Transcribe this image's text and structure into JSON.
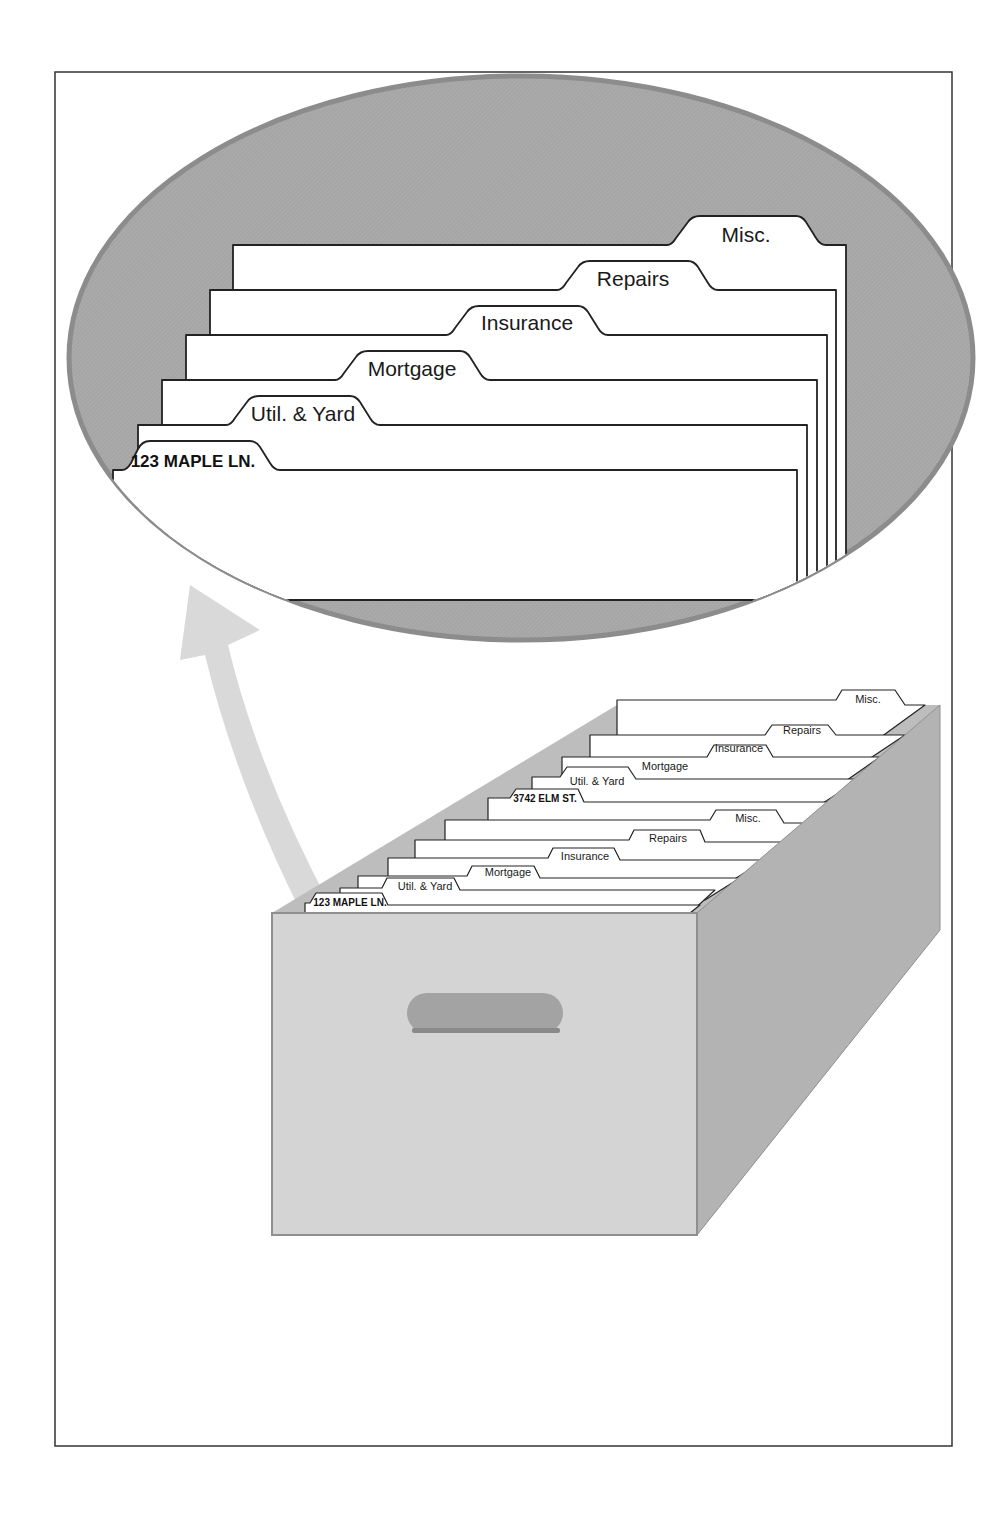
{
  "figure": {
    "type": "illustration",
    "colors": {
      "frame": "#333333",
      "ellipse_fill": "#a9a9a9",
      "ellipse_edge": "#8c8c8c",
      "arrow": "#d9d9d9",
      "box_front": "#d4d4d4",
      "box_side": "#b3b3b3",
      "box_inner": "#bdbdbd",
      "handle": "#a0a0a0",
      "folder": "#ffffff",
      "outline": "#222222"
    }
  },
  "magnified_view": {
    "folders": [
      {
        "label": "Misc."
      },
      {
        "label": "Repairs"
      },
      {
        "label": "Insurance"
      },
      {
        "label": "Mortgage"
      },
      {
        "label": "Util. & Yard"
      },
      {
        "label": "123 MAPLE LN."
      }
    ]
  },
  "file_box": {
    "property_back": {
      "label": "3742 ELM ST.",
      "tabs": [
        "Util. & Yard",
        "Mortgage",
        "Insurance",
        "Repairs",
        "Misc."
      ]
    },
    "property_front": {
      "label": "123 MAPLE LN.",
      "tabs": [
        "Util. & Yard",
        "Mortgage",
        "Insurance",
        "Repairs",
        "Misc."
      ]
    }
  }
}
